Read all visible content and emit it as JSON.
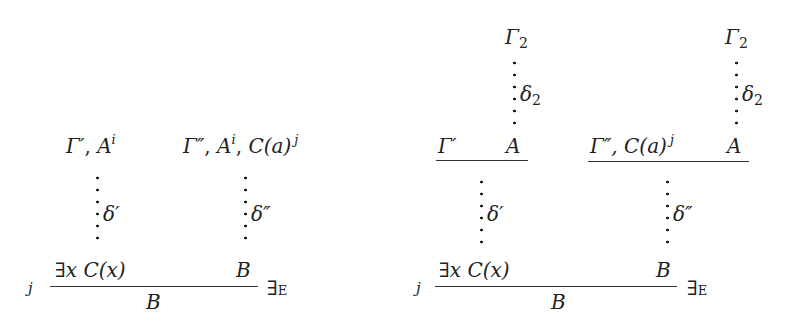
{
  "left_proof": {
    "premise_1": {
      "gamma": "Γ′",
      "sep": ", ",
      "formula": "A",
      "mark": "i"
    },
    "premise_2": {
      "gamma": "Γ″",
      "sep1": ", ",
      "formula": "A",
      "mark": "i",
      "sep2": ", ",
      "formula2": "C(a)",
      "mark2": "j"
    },
    "derivation_1": "δ′",
    "derivation_2": "δ″",
    "minor_premise_1": "∃x C(x)",
    "minor_premise_2": "B",
    "conclusion": "B",
    "discharge_index": "j",
    "rule_name": {
      "symbol": "∃",
      "letter": "E"
    }
  },
  "right_proof": {
    "top_1": {
      "gamma": "Γ",
      "index": "2",
      "derivation": "δ",
      "derivation_index": "2"
    },
    "top_2": {
      "gamma": "Γ",
      "index": "2",
      "derivation": "δ",
      "derivation_index": "2"
    },
    "upper_rule_1": {
      "left": "Γ′",
      "right": "A"
    },
    "upper_rule_2": {
      "left": "Γ″, C(a)",
      "mark": "j",
      "right": "A"
    },
    "derivation_1": "δ′",
    "derivation_2": "δ″",
    "minor_premise_1": "∃x C(x)",
    "minor_premise_2": "B",
    "conclusion": "B",
    "discharge_index": "j",
    "rule_name": {
      "symbol": "∃",
      "letter": "E"
    }
  }
}
